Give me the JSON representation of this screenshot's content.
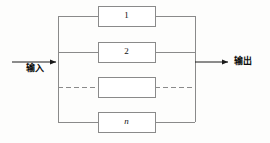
{
  "diagram": {
    "type": "reliability-block-diagram",
    "arrangement": "parallel",
    "title": "",
    "input": {
      "label": "输入",
      "arrow": "right-arrow-icon"
    },
    "output": {
      "label": "输出",
      "arrow": "right-arrow-icon"
    },
    "blocks": [
      {
        "id": "block-1",
        "label": "1",
        "style": "solid",
        "italic": false
      },
      {
        "id": "block-2",
        "label": "2",
        "style": "solid",
        "italic": false
      },
      {
        "id": "block-ellipsis",
        "label": "",
        "style": "dashed",
        "italic": false
      },
      {
        "id": "block-n",
        "label": "n",
        "style": "solid",
        "italic": true
      }
    ],
    "colors": {
      "line": "#8a8a8a",
      "line_dark": "#6f6f6f",
      "box_fill": "#ffffff",
      "text": "#111111",
      "background": "#fdfdfc"
    },
    "geometry": {
      "left_bus_x": 58,
      "right_bus_x": 195,
      "bus_top_y": 16,
      "bus_bottom_y": 122,
      "box_left_x": 98,
      "box_right_x": 155,
      "box_height": 20,
      "row_centers": [
        16,
        52,
        87,
        122
      ],
      "input_arrow_x1": 12,
      "input_arrow_x2": 58,
      "output_arrow_x1": 195,
      "output_arrow_x2": 230,
      "io_y": 62
    }
  }
}
